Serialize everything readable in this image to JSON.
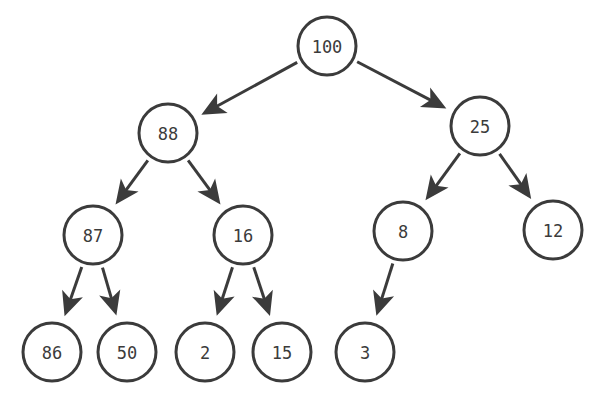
{
  "diagram": {
    "type": "binary-tree",
    "colors": {
      "stroke": "#3b3b3b",
      "fill": "#ffffff",
      "text": "#3b3b3b"
    },
    "node_radius": 29,
    "nodes": [
      {
        "id": "n100",
        "label": "100",
        "x": 327,
        "y": 46
      },
      {
        "id": "n88",
        "label": "88",
        "x": 168,
        "y": 133
      },
      {
        "id": "n25",
        "label": "25",
        "x": 480,
        "y": 126
      },
      {
        "id": "n87",
        "label": "87",
        "x": 93,
        "y": 235
      },
      {
        "id": "n16",
        "label": "16",
        "x": 243,
        "y": 235
      },
      {
        "id": "n8",
        "label": "8",
        "x": 403,
        "y": 231
      },
      {
        "id": "n12",
        "label": "12",
        "x": 553,
        "y": 230
      },
      {
        "id": "n86",
        "label": "86",
        "x": 52,
        "y": 352
      },
      {
        "id": "n50",
        "label": "50",
        "x": 127,
        "y": 352
      },
      {
        "id": "n2",
        "label": "2",
        "x": 205,
        "y": 352
      },
      {
        "id": "n15",
        "label": "15",
        "x": 282,
        "y": 352
      },
      {
        "id": "n3",
        "label": "3",
        "x": 365,
        "y": 352
      }
    ],
    "edges": [
      {
        "from": "n100",
        "to": "n88"
      },
      {
        "from": "n100",
        "to": "n25"
      },
      {
        "from": "n88",
        "to": "n87"
      },
      {
        "from": "n88",
        "to": "n16"
      },
      {
        "from": "n25",
        "to": "n8"
      },
      {
        "from": "n25",
        "to": "n12"
      },
      {
        "from": "n87",
        "to": "n86"
      },
      {
        "from": "n87",
        "to": "n50"
      },
      {
        "from": "n16",
        "to": "n2"
      },
      {
        "from": "n16",
        "to": "n15"
      },
      {
        "from": "n8",
        "to": "n3"
      }
    ]
  }
}
